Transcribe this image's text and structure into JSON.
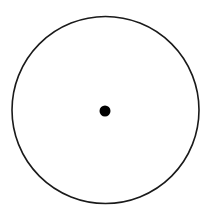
{
  "diagram": {
    "background": "#ffffff",
    "circle": {
      "cx": 105.5,
      "cy": 110,
      "r": 93.5,
      "stroke": "#1a1a1a",
      "stroke_width": 1.6,
      "fill": "none"
    },
    "center_dot": {
      "cx": 105,
      "cy": 111,
      "r": 5.5,
      "fill": "#000000"
    }
  }
}
